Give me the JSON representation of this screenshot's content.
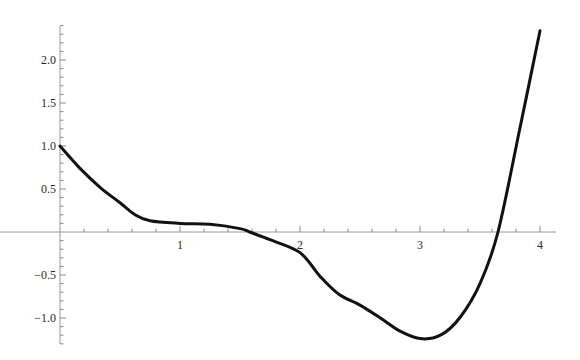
{
  "chart_data": {
    "type": "line",
    "title": "",
    "xlabel": "",
    "ylabel": "",
    "xlim": [
      0,
      4.1
    ],
    "ylim": [
      -1.3,
      2.4
    ],
    "grid": false,
    "legend": null,
    "x_ticks": [
      1,
      2,
      3,
      4
    ],
    "x_tick_labels": [
      "1",
      "2",
      "3",
      "4"
    ],
    "y_ticks": [
      2.0,
      1.5,
      1.0,
      0.5,
      -0.5,
      -1.0
    ],
    "y_tick_labels": [
      "2.0",
      "1.5",
      "1.0",
      "0.5",
      "-0.5",
      "-1.0"
    ],
    "series": [
      {
        "name": "f(x)",
        "color": "#111111",
        "x": [
          0.0,
          0.167,
          0.333,
          0.5,
          0.625,
          0.75,
          1.0,
          1.25,
          1.5,
          1.58,
          1.75,
          2.0,
          2.17,
          2.33,
          2.5,
          2.67,
          2.83,
          3.0,
          3.17,
          3.33,
          3.5,
          3.65,
          3.83,
          4.0
        ],
        "y": [
          1.0,
          0.74,
          0.52,
          0.34,
          0.2,
          0.13,
          0.1,
          0.09,
          0.04,
          0.0,
          -0.09,
          -0.24,
          -0.52,
          -0.73,
          -0.85,
          -1.0,
          -1.15,
          -1.24,
          -1.2,
          -1.0,
          -0.6,
          0.0,
          1.19,
          2.34
        ]
      }
    ]
  }
}
